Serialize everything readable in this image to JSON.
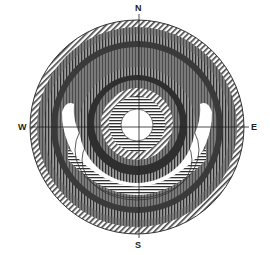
{
  "diagram": {
    "type": "concentric-ring compass diagram",
    "center": [
      137,
      127
    ],
    "outer_radius": 107,
    "inner_hole_radius": 16,
    "colors": {
      "background": "#ffffff",
      "dark": "#2a2a2a",
      "mid": "#6a6a6a",
      "light": "#b8b8b8",
      "line": "#333333"
    }
  },
  "compass": {
    "north": "N",
    "south": "S",
    "west": "W",
    "east": "E"
  }
}
